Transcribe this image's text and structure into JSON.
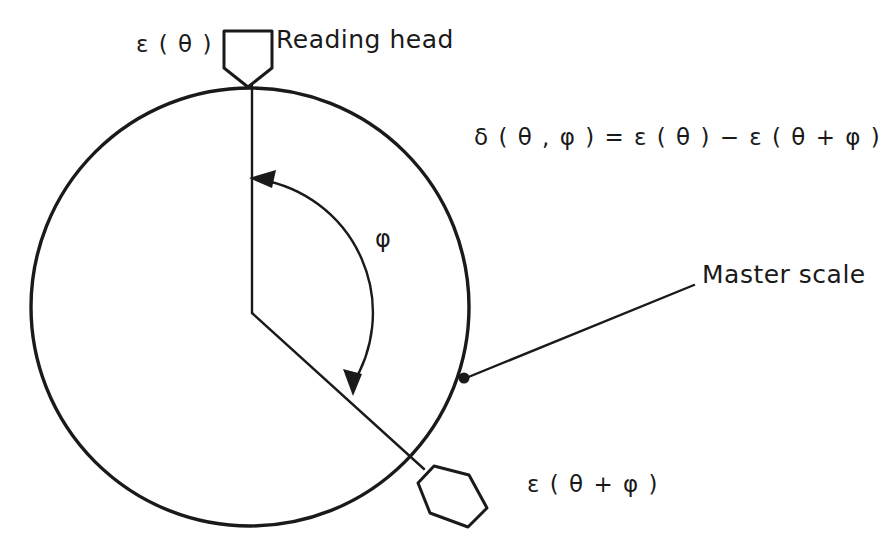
{
  "figure": {
    "background_color": "#ffffff",
    "stroke_color": "#1a1a1a"
  },
  "labels": {
    "reading_head": "Reading head",
    "master_scale": "Master scale",
    "epsilon_theta": "ε ( θ )",
    "epsilon_theta_plus_phi": "ε ( θ + φ )",
    "equation": "δ ( θ , φ )  =  ε ( θ ) − ε ( θ + φ )",
    "phi": "φ"
  },
  "geometry": {
    "circle": {
      "cx": 250,
      "cy": 307,
      "r": 219
    },
    "center_vertex": {
      "x": 252,
      "y": 313
    },
    "radius_top_point": {
      "x": 252,
      "y": 88
    },
    "radius_lower_point": {
      "x": 416,
      "y": 458
    },
    "arc_label_point": {
      "x": 383,
      "y": 240
    },
    "master_scale_dot": {
      "x": 463,
      "y": 377
    },
    "leader_line_end": {
      "x": 694,
      "y": 285
    }
  }
}
